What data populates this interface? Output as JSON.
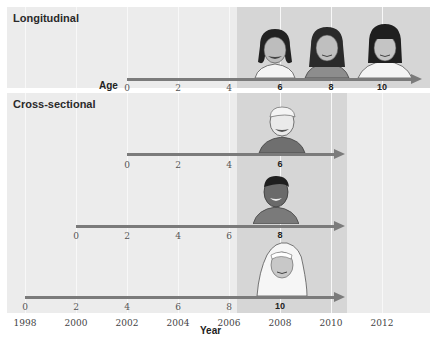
{
  "panels": {
    "longitudinal": {
      "title": "Longitudinal",
      "axis_label": "Age"
    },
    "cross_sectional": {
      "title": "Cross-sectional"
    }
  },
  "x_axis": {
    "label": "Year",
    "years": [
      "1998",
      "2000",
      "2002",
      "2004",
      "2006",
      "2008",
      "2010",
      "2012"
    ]
  },
  "rows": {
    "longitudinal": {
      "ticks": [
        "0",
        "2",
        "4",
        "6",
        "8",
        "10"
      ],
      "bold_ticks": [
        "6",
        "8",
        "10"
      ]
    },
    "cross_1": {
      "ticks": [
        "0",
        "2",
        "4",
        "6"
      ],
      "bold_ticks": [
        "6"
      ]
    },
    "cross_2": {
      "ticks": [
        "0",
        "2",
        "4",
        "6",
        "8"
      ],
      "bold_ticks": [
        "8"
      ]
    },
    "cross_3": {
      "ticks": [
        "0",
        "2",
        "4",
        "6",
        "8",
        "10"
      ],
      "bold_ticks": [
        "10"
      ]
    }
  },
  "figures": {
    "longitudinal": [
      "girl age 6",
      "girl age 8",
      "girl age 10"
    ],
    "cross_sectional": [
      "boy age 6",
      "boy age 8",
      "girl in hijab age 10"
    ]
  },
  "colors": {
    "panel_bg": "#ececec",
    "shade": "#d6d6d6",
    "arrow": "#7b7b7b",
    "gridline": "#f8f8f8"
  }
}
